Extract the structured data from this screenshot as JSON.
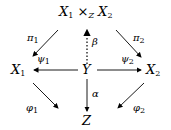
{
  "diagram": {
    "nodes": {
      "product": {
        "base1": "X",
        "sub1": "1",
        "times": "×",
        "subZ": "Z",
        "base2": "X",
        "sub2": "2"
      },
      "X1": {
        "base": "X",
        "sub": "1"
      },
      "Y": {
        "base": "Y"
      },
      "X2": {
        "base": "X",
        "sub": "2"
      },
      "Z": {
        "base": "Z"
      }
    },
    "arrows": {
      "pi1": {
        "base": "π",
        "sub": "1",
        "from": "product",
        "to": "X1",
        "style": "solid"
      },
      "pi2": {
        "base": "π",
        "sub": "2",
        "from": "product",
        "to": "X2",
        "style": "solid"
      },
      "beta": {
        "base": "β",
        "from": "Y",
        "to": "product",
        "style": "dotted"
      },
      "psi1": {
        "base": "ψ",
        "sub": "1",
        "from": "Y",
        "to": "X1",
        "style": "solid"
      },
      "psi2": {
        "base": "ψ",
        "sub": "2",
        "from": "Y",
        "to": "X2",
        "style": "solid"
      },
      "alpha": {
        "base": "α",
        "from": "Y",
        "to": "Z",
        "style": "solid"
      },
      "phi1": {
        "base": "φ",
        "sub": "1",
        "from": "X1",
        "to": "Z",
        "style": "solid"
      },
      "phi2": {
        "base": "φ",
        "sub": "2",
        "from": "X2",
        "to": "Z",
        "style": "solid"
      }
    }
  }
}
